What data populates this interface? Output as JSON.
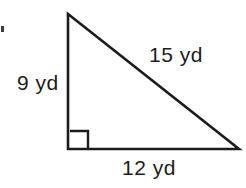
{
  "figure": {
    "kind": "right-triangle",
    "stroke_color": "#1c1c1c",
    "background_color": "#ffffff",
    "vertices": {
      "apex": [
        68,
        14
      ],
      "right_angle": [
        68,
        149
      ],
      "far": [
        239,
        149
      ]
    },
    "right_angle_marker": {
      "size": 18,
      "present": true
    },
    "labels": {
      "vertical_leg": "9 yd",
      "hypotenuse": "15 yd",
      "horizontal_leg": "12 yd"
    }
  }
}
